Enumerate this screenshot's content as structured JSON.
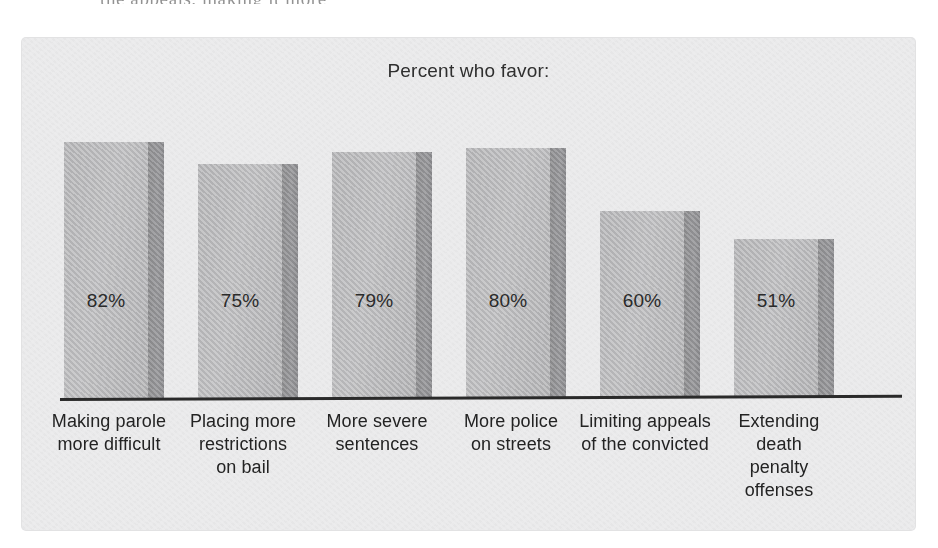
{
  "scan": {
    "top_fragment": "the appeals, making it more"
  },
  "chart_data": {
    "type": "bar",
    "title": "Percent who favor:",
    "xlabel": "",
    "ylabel": "",
    "ylim": [
      0,
      100
    ],
    "grid": false,
    "legend": "none",
    "value_suffix": "%",
    "categories": [
      "Making parole more difficult",
      "Placing more restrictions on bail",
      "More severe sentences",
      "More police on streets",
      "Limiting appeals of the convicted",
      "Extending death penalty offenses"
    ],
    "category_lines": [
      [
        "Making parole",
        "more difficult"
      ],
      [
        "Placing more",
        "restrictions",
        "on bail"
      ],
      [
        "More severe",
        "sentences"
      ],
      [
        "More police",
        "on streets"
      ],
      [
        "Limiting appeals",
        "of the convicted"
      ],
      [
        "Extending",
        "death",
        "penalty",
        "offenses"
      ]
    ],
    "values": [
      82,
      75,
      79,
      80,
      60,
      51
    ],
    "value_labels": [
      "82%",
      "75%",
      "79%",
      "80%",
      "60%",
      "51%"
    ],
    "colors": {
      "panel_background": "#ececed",
      "bar_face": "#bdbdbf",
      "bar_side": "#929295",
      "axis": "#2a2a2a",
      "text": "#232323",
      "page_background": "#ffffff"
    }
  }
}
